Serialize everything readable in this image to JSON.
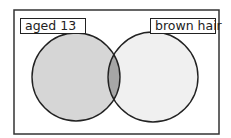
{
  "diagram": {
    "type": "venn",
    "sets": [
      {
        "label": "aged 13",
        "fill": "#d6d6d6"
      },
      {
        "label": "brown hair",
        "fill": "#f0f0f0"
      }
    ],
    "intersection_fill": "#a6a6a6",
    "frame_color": "#333333"
  }
}
